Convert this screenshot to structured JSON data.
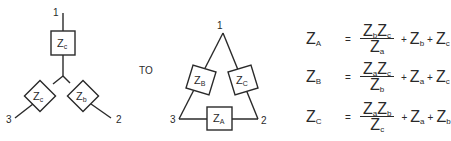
{
  "diagram": {
    "connector_label": "TO",
    "wye": {
      "nodes": {
        "n1": "1",
        "n2": "2",
        "n3": "3"
      },
      "impedances": {
        "top": {
          "main": "Z",
          "sub": "c"
        },
        "left": {
          "main": "Z",
          "sub": "c"
        },
        "right": {
          "main": "Z",
          "sub": "b"
        }
      }
    },
    "delta": {
      "nodes": {
        "n1": "1",
        "n2": "2",
        "n3": "3"
      },
      "impedances": {
        "left": {
          "main": "Z",
          "sub": "B"
        },
        "right": {
          "main": "Z",
          "sub": "C"
        },
        "bottom": {
          "main": "Z",
          "sub": "A"
        }
      }
    },
    "equations": [
      {
        "lhs_main": "Z",
        "lhs_sub": "A",
        "equals": "=",
        "num": [
          {
            "main": "Z",
            "sub": "b"
          },
          {
            "main": "Z",
            "sub": "c"
          }
        ],
        "den": {
          "main": "Z",
          "sub": "a"
        },
        "plus1": "+",
        "t1": {
          "main": "Z",
          "sub": "b"
        },
        "plus2": "+",
        "t2": {
          "main": "Z",
          "sub": "c"
        }
      },
      {
        "lhs_main": "Z",
        "lhs_sub": "B",
        "equals": "=",
        "num": [
          {
            "main": "Z",
            "sub": "a"
          },
          {
            "main": "Z",
            "sub": "c"
          }
        ],
        "den": {
          "main": "Z",
          "sub": "b"
        },
        "plus1": "+",
        "t1": {
          "main": "Z",
          "sub": "a"
        },
        "plus2": "+",
        "t2": {
          "main": "Z",
          "sub": "c"
        }
      },
      {
        "lhs_main": "Z",
        "lhs_sub": "C",
        "equals": "=",
        "num": [
          {
            "main": "Z",
            "sub": "a"
          },
          {
            "main": "Z",
            "sub": "b"
          }
        ],
        "den": {
          "main": "Z",
          "sub": "c"
        },
        "plus1": "+",
        "t1": {
          "main": "Z",
          "sub": "a"
        },
        "plus2": "+",
        "t2": {
          "main": "Z",
          "sub": "b"
        }
      }
    ],
    "colors": {
      "ink": "#2a2a2a",
      "background": "#ffffff"
    }
  }
}
